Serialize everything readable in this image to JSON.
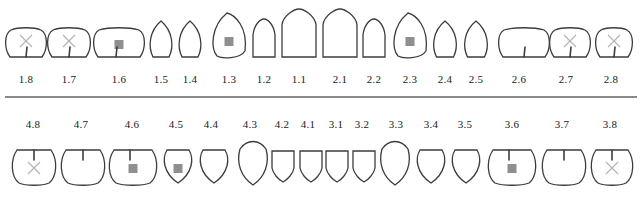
{
  "colors": {
    "outline": "#3c3c3c",
    "filling": "#8f8f8f",
    "missing_mark": "#b5b5b5",
    "divider": "#8a8a8a"
  },
  "legend_semantics": {
    "filling": "grey square = restoration/filling",
    "x": "light X = marked / missing / extraction",
    "groove": "vertical line = fissure/notch"
  },
  "upper": {
    "teeth": [
      {
        "id": "1.8",
        "cx": 26,
        "w": 40,
        "shape": "molar",
        "marks": [
          "x",
          "groove"
        ]
      },
      {
        "id": "1.7",
        "cx": 69,
        "w": 42,
        "shape": "molar",
        "marks": [
          "x",
          "groove"
        ]
      },
      {
        "id": "1.6",
        "cx": 119,
        "w": 50,
        "shape": "molar",
        "marks": [
          "filling",
          "groove"
        ]
      },
      {
        "id": "1.5",
        "cx": 161,
        "w": 24,
        "shape": "premolar",
        "marks": []
      },
      {
        "id": "1.4",
        "cx": 190,
        "w": 24,
        "shape": "premolar",
        "marks": []
      },
      {
        "id": "1.3",
        "cx": 229,
        "w": 34,
        "shape": "canine",
        "marks": [
          "filling"
        ]
      },
      {
        "id": "1.2",
        "cx": 264,
        "w": 24,
        "shape": "incisor",
        "marks": []
      },
      {
        "id": "1.1",
        "cx": 299,
        "w": 36,
        "shape": "incisor",
        "marks": []
      },
      {
        "id": "2.1",
        "cx": 340,
        "w": 36,
        "shape": "incisor",
        "marks": []
      },
      {
        "id": "2.2",
        "cx": 374,
        "w": 24,
        "shape": "incisor",
        "marks": []
      },
      {
        "id": "2.3",
        "cx": 410,
        "w": 34,
        "shape": "canine",
        "marks": [
          "filling"
        ]
      },
      {
        "id": "2.4",
        "cx": 445,
        "w": 25,
        "shape": "premolar",
        "marks": []
      },
      {
        "id": "2.5",
        "cx": 476,
        "w": 25,
        "shape": "premolar",
        "marks": []
      },
      {
        "id": "2.6",
        "cx": 524,
        "w": 50,
        "shape": "molar",
        "marks": [
          "groove"
        ]
      },
      {
        "id": "2.7",
        "cx": 570,
        "w": 40,
        "shape": "molar",
        "marks": [
          "x",
          "groove"
        ]
      },
      {
        "id": "2.8",
        "cx": 614,
        "w": 36,
        "shape": "molar",
        "marks": [
          "x",
          "groove"
        ]
      }
    ],
    "labels_y": 73,
    "labels_cx": [
      26,
      69,
      119,
      161,
      190,
      229,
      264,
      299,
      340,
      374,
      410,
      445,
      476,
      519,
      566,
      611
    ]
  },
  "lower": {
    "teeth": [
      {
        "id": "4.8",
        "cx": 34,
        "w": 42,
        "shape": "molar",
        "marks": [
          "x",
          "groove"
        ]
      },
      {
        "id": "4.7",
        "cx": 83,
        "w": 42,
        "shape": "molar",
        "marks": [
          "groove"
        ]
      },
      {
        "id": "4.6",
        "cx": 133,
        "w": 46,
        "shape": "molar",
        "marks": [
          "filling",
          "groove"
        ]
      },
      {
        "id": "4.5",
        "cx": 178,
        "w": 30,
        "shape": "premolar",
        "marks": [
          "filling"
        ]
      },
      {
        "id": "4.4",
        "cx": 214,
        "w": 30,
        "shape": "premolar",
        "marks": []
      },
      {
        "id": "4.3",
        "cx": 253,
        "w": 32,
        "shape": "canine",
        "marks": []
      },
      {
        "id": "4.2",
        "cx": 283,
        "w": 24,
        "shape": "incisor",
        "marks": []
      },
      {
        "id": "4.1",
        "cx": 311,
        "w": 24,
        "shape": "incisor",
        "marks": []
      },
      {
        "id": "3.1",
        "cx": 337,
        "w": 24,
        "shape": "incisor",
        "marks": []
      },
      {
        "id": "3.2",
        "cx": 364,
        "w": 24,
        "shape": "incisor",
        "marks": []
      },
      {
        "id": "3.3",
        "cx": 395,
        "w": 32,
        "shape": "canine",
        "marks": []
      },
      {
        "id": "3.4",
        "cx": 431,
        "w": 30,
        "shape": "premolar",
        "marks": []
      },
      {
        "id": "3.5",
        "cx": 466,
        "w": 30,
        "shape": "premolar",
        "marks": []
      },
      {
        "id": "3.6",
        "cx": 512,
        "w": 46,
        "shape": "molar",
        "marks": [
          "filling",
          "groove"
        ]
      },
      {
        "id": "3.7",
        "cx": 564,
        "w": 42,
        "shape": "molar",
        "marks": [
          "groove"
        ]
      },
      {
        "id": "3.8",
        "cx": 612,
        "w": 40,
        "shape": "molar",
        "marks": [
          "x",
          "groove"
        ]
      }
    ],
    "labels_y": 118,
    "labels_cx": [
      33,
      81,
      132,
      176,
      211,
      250,
      282,
      308,
      336,
      362,
      396,
      431,
      465,
      512,
      562,
      610
    ]
  }
}
